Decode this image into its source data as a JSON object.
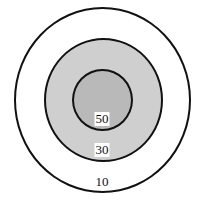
{
  "diagram": {
    "type": "concentric-target",
    "rings": [
      {
        "name": "outer",
        "score": "10",
        "fill": "#ffffff",
        "stroke": "#111111"
      },
      {
        "name": "middle",
        "score": "30",
        "fill": "#cfcfcf",
        "stroke": "#111111"
      },
      {
        "name": "inner",
        "score": "50",
        "fill": "#b9b9b9",
        "stroke": "#111111"
      }
    ],
    "labels": {
      "outer": "10",
      "middle": "30",
      "inner": "50"
    }
  }
}
